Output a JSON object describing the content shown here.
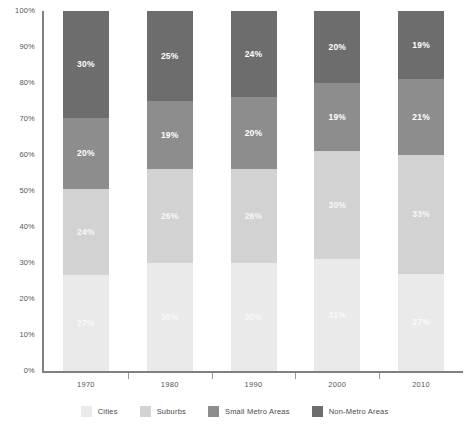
{
  "chart_data": {
    "type": "bar",
    "subtype": "stacked-bar-100-percent",
    "title": "",
    "subtitle": "",
    "xlabel": "",
    "ylabel": "",
    "ylim": [
      0,
      100
    ],
    "y_ticks": [
      "0%",
      "10%",
      "20%",
      "30%",
      "40%",
      "50%",
      "60%",
      "70%",
      "80%",
      "90%",
      "100%"
    ],
    "y_tick_values": [
      0,
      10,
      20,
      30,
      40,
      50,
      60,
      70,
      80,
      90,
      100
    ],
    "grid": false,
    "legend_position": "bottom",
    "categories": [
      "1970",
      "1980",
      "1990",
      "2000",
      "2010"
    ],
    "series": [
      {
        "name": "Cities",
        "color": "#eaeaea",
        "values": [
          27,
          30,
          30,
          31,
          27
        ],
        "labels": [
          "27%",
          "30%",
          "30%",
          "31%",
          "27%"
        ]
      },
      {
        "name": "Suburbs",
        "color": "#d2d2d2",
        "values": [
          24,
          26,
          26,
          30,
          33
        ],
        "labels": [
          "24%",
          "26%",
          "26%",
          "30%",
          "33%"
        ]
      },
      {
        "name": "Small Metro Areas",
        "color": "#8d8d8d",
        "values": [
          20,
          19,
          20,
          19,
          21
        ],
        "labels": [
          "20%",
          "19%",
          "20%",
          "19%",
          "21%"
        ]
      },
      {
        "name": "Non-Metro Areas",
        "color": "#6d6d6d",
        "values": [
          30,
          25,
          24,
          20,
          19
        ],
        "labels": [
          "30%",
          "25%",
          "24%",
          "20%",
          "19%"
        ]
      }
    ]
  },
  "axis": {
    "y_ticks": [
      {
        "label": "100%",
        "value": 100
      },
      {
        "label": "90%",
        "value": 90
      },
      {
        "label": "80%",
        "value": 80
      },
      {
        "label": "70%",
        "value": 70
      },
      {
        "label": "60%",
        "value": 60
      },
      {
        "label": "50%",
        "value": 50
      },
      {
        "label": "40%",
        "value": 40
      },
      {
        "label": "30%",
        "value": 30
      },
      {
        "label": "20%",
        "value": 20
      },
      {
        "label": "10%",
        "value": 10
      },
      {
        "label": "0%",
        "value": 0
      }
    ],
    "x_ticks": [
      "1970",
      "1980",
      "1990",
      "2000",
      "2010"
    ]
  },
  "legend": {
    "items": [
      {
        "label": "Cities",
        "color": "#eaeaea"
      },
      {
        "label": "Suburbs",
        "color": "#d2d2d2"
      },
      {
        "label": "Small Metro Areas",
        "color": "#8d8d8d"
      },
      {
        "label": "Non-Metro Areas",
        "color": "#6d6d6d"
      }
    ]
  },
  "colors": {
    "axis_line": "#808080",
    "tick_mark": "#9a9a9a",
    "tick_text": "#555555",
    "segment_text": "#ffffff",
    "background": "#ffffff"
  }
}
